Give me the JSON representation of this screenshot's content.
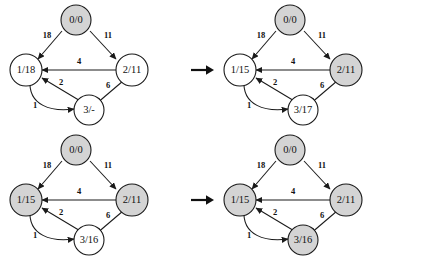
{
  "figure": {
    "title": "",
    "panel_count": 4,
    "transition_arrow_icon": "right-arrow-icon",
    "node_shaded_color": "#d4d4d4",
    "node_plain_color": "#ffffff",
    "stroke_color": "#1a1a1a"
  },
  "shared": {
    "edges": [
      {
        "id": "e0_1",
        "from": "n0",
        "to": "n1",
        "label": "18"
      },
      {
        "id": "e0_2",
        "from": "n0",
        "to": "n2",
        "label": "11"
      },
      {
        "id": "e2_1",
        "from": "n2",
        "to": "n1",
        "label": "4"
      },
      {
        "id": "e3_1",
        "from": "n3",
        "to": "n1",
        "label": "2"
      },
      {
        "id": "e2_3",
        "from": "n2",
        "to": "n3",
        "label": "6"
      },
      {
        "id": "e1_3",
        "from": "n1",
        "to": "n3",
        "label": "1"
      }
    ]
  },
  "panels": [
    {
      "id": "panel-1",
      "nodes": [
        {
          "id": "n0",
          "label": "0/0",
          "shaded": true
        },
        {
          "id": "n1",
          "label": "1/18",
          "shaded": false
        },
        {
          "id": "n2",
          "label": "2/11",
          "shaded": false
        },
        {
          "id": "n3",
          "label": "3/-",
          "shaded": false
        }
      ],
      "edge_labels": {
        "e0_1": "18",
        "e0_2": "11",
        "e2_1": "4",
        "e3_1": "2",
        "e2_3": "6",
        "e1_3": "1"
      }
    },
    {
      "id": "panel-2",
      "nodes": [
        {
          "id": "n0",
          "label": "0/0",
          "shaded": true
        },
        {
          "id": "n1",
          "label": "1/15",
          "shaded": false
        },
        {
          "id": "n2",
          "label": "2/11",
          "shaded": true
        },
        {
          "id": "n3",
          "label": "3/17",
          "shaded": false
        }
      ],
      "edge_labels": {
        "e0_1": "18",
        "e0_2": "11",
        "e2_1": "4",
        "e3_1": "2",
        "e2_3": "6",
        "e1_3": "1"
      }
    },
    {
      "id": "panel-3",
      "nodes": [
        {
          "id": "n0",
          "label": "0/0",
          "shaded": true
        },
        {
          "id": "n1",
          "label": "1/15",
          "shaded": true
        },
        {
          "id": "n2",
          "label": "2/11",
          "shaded": true
        },
        {
          "id": "n3",
          "label": "3/16",
          "shaded": false
        }
      ],
      "edge_labels": {
        "e0_1": "18",
        "e0_2": "11",
        "e2_1": "4",
        "e3_1": "2",
        "e2_3": "6",
        "e1_3": "1"
      }
    },
    {
      "id": "panel-4",
      "nodes": [
        {
          "id": "n0",
          "label": "0/0",
          "shaded": true
        },
        {
          "id": "n1",
          "label": "1/15",
          "shaded": true
        },
        {
          "id": "n2",
          "label": "2/11",
          "shaded": true
        },
        {
          "id": "n3",
          "label": "3/16",
          "shaded": true
        }
      ],
      "edge_labels": {
        "e0_1": "18",
        "e0_2": "11",
        "e2_1": "4",
        "e3_1": "2",
        "e2_3": "6",
        "e1_3": "1"
      }
    }
  ]
}
